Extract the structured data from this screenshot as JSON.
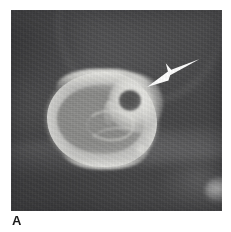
{
  "figure": {
    "panel_label": "A",
    "modality": "CT",
    "view": "axial bone window",
    "background_color": "#4b4b4b",
    "page_background": "#ffffff"
  },
  "image": {
    "name": "axial-ct-slice",
    "alt_text": "Axial CT image of a carpal bone showing a round lucent nidus with surrounding sclerosis",
    "bone": {
      "label": "carpal bone",
      "cortex_color": "#d8d8d4",
      "medulla_color": "#8a8a88"
    },
    "lesion": {
      "label": "nidus",
      "color": "#555555",
      "rim_label": "reactive sclerosis",
      "rim_color": "#eeeeea"
    },
    "adjacent_structure": {
      "label": "adjacent bone fragment",
      "color": "#d7d7d6"
    }
  },
  "annotations": {
    "arrow": {
      "name": "arrow-pointer",
      "color": "#ffffff",
      "direction": "down-left",
      "target": "nidus"
    }
  }
}
